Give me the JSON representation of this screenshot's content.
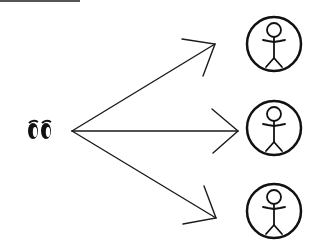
{
  "diagram": {
    "type": "one-to-many broadcast",
    "source": {
      "icon": "eyes-icon",
      "label": ""
    },
    "targets": [
      {
        "icon": "person-in-circle-icon",
        "label": ""
      },
      {
        "icon": "person-in-circle-icon",
        "label": ""
      },
      {
        "icon": "person-in-circle-icon",
        "label": ""
      }
    ],
    "arrow_count": 3,
    "colors": {
      "stroke": "#1a1a1a",
      "background": "#ffffff"
    }
  }
}
